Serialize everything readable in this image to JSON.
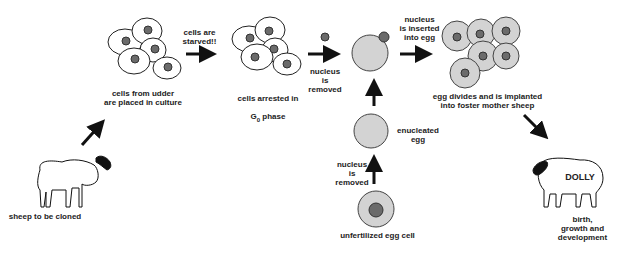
{
  "colors": {
    "egg_fill": "#d3d3d3",
    "nucleus_fill": "#6b6b6b",
    "cell_fill": "#ffffff",
    "stroke": "#222222"
  },
  "steps": {
    "sheep_donor": "sheep to be cloned",
    "udder_cells": "cells from udder\nare placed in culture",
    "starved": "cells are\nstarved!!",
    "arrested_line1": "cells arrested in",
    "arrested_g": "G",
    "arrested_sub": "0",
    "arrested_phase": " phase",
    "nucleus_removed_top": "nucleus\nis\nremoved",
    "nucleus_inserted": "nucleus\nis inserted\ninto egg",
    "egg_divides": "egg divides and is implanted\ninto foster mother sheep",
    "enucleated": "enucleated\negg",
    "nucleus_removed_bottom": "nucleus\nis\nremoved",
    "unfertilized": "unfertilized egg cell",
    "dolly_label": "DOLLY",
    "birth": "birth,\ngrowth and\ndevelopment"
  }
}
